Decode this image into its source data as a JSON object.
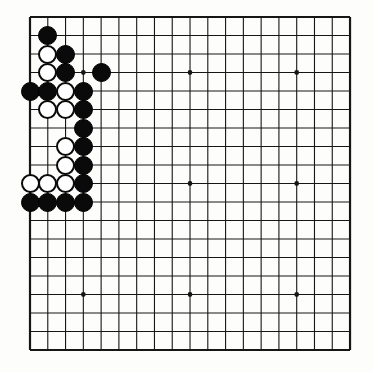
{
  "board": {
    "title": "Go board position",
    "size": 19,
    "geometry": {
      "left": 30,
      "top": 17,
      "right": 350,
      "bottom": 350,
      "cell_x": 17.78,
      "cell_y": 18.5,
      "stone_diameter": 19,
      "line_width": 1.1,
      "edge_line_width": 2.2,
      "star_radius": 2.4
    },
    "colors": {
      "background": "#fdfdfb",
      "line": "#161616",
      "black_stone": "#0a0a0a",
      "white_stone": "#ffffff",
      "white_stone_border": "#0a0a0a",
      "star_point": "#161616"
    },
    "star_points": [
      {
        "col": 4,
        "row": 4
      },
      {
        "col": 10,
        "row": 4
      },
      {
        "col": 16,
        "row": 4
      },
      {
        "col": 4,
        "row": 10
      },
      {
        "col": 10,
        "row": 10
      },
      {
        "col": 16,
        "row": 10
      },
      {
        "col": 4,
        "row": 16
      },
      {
        "col": 10,
        "row": 16
      },
      {
        "col": 16,
        "row": 16
      }
    ],
    "stones": [
      {
        "col": 2,
        "row": 2,
        "color": "black"
      },
      {
        "col": 2,
        "row": 3,
        "color": "white"
      },
      {
        "col": 3,
        "row": 3,
        "color": "black"
      },
      {
        "col": 2,
        "row": 4,
        "color": "white"
      },
      {
        "col": 3,
        "row": 4,
        "color": "black"
      },
      {
        "col": 5,
        "row": 4,
        "color": "black"
      },
      {
        "col": 1,
        "row": 5,
        "color": "black"
      },
      {
        "col": 2,
        "row": 5,
        "color": "black"
      },
      {
        "col": 3,
        "row": 5,
        "color": "white"
      },
      {
        "col": 4,
        "row": 5,
        "color": "black"
      },
      {
        "col": 2,
        "row": 6,
        "color": "white"
      },
      {
        "col": 3,
        "row": 6,
        "color": "white"
      },
      {
        "col": 4,
        "row": 6,
        "color": "black"
      },
      {
        "col": 4,
        "row": 7,
        "color": "black"
      },
      {
        "col": 3,
        "row": 8,
        "color": "white"
      },
      {
        "col": 4,
        "row": 8,
        "color": "black"
      },
      {
        "col": 3,
        "row": 9,
        "color": "white"
      },
      {
        "col": 4,
        "row": 9,
        "color": "black"
      },
      {
        "col": 1,
        "row": 10,
        "color": "white"
      },
      {
        "col": 2,
        "row": 10,
        "color": "white"
      },
      {
        "col": 3,
        "row": 10,
        "color": "white"
      },
      {
        "col": 4,
        "row": 10,
        "color": "black"
      },
      {
        "col": 1,
        "row": 11,
        "color": "black"
      },
      {
        "col": 2,
        "row": 11,
        "color": "black"
      },
      {
        "col": 3,
        "row": 11,
        "color": "black"
      },
      {
        "col": 4,
        "row": 11,
        "color": "black"
      }
    ]
  }
}
